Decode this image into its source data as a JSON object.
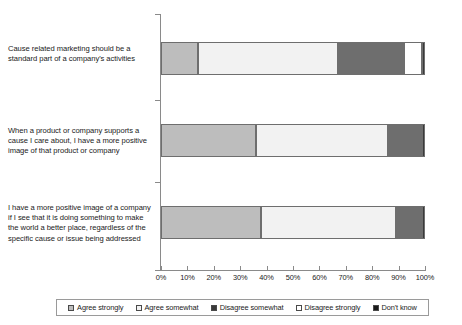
{
  "chart_data": {
    "type": "bar",
    "orientation": "horizontal",
    "stacked": true,
    "stack_mode": "percent",
    "title": "",
    "xlabel": "",
    "ylabel": "",
    "xlim": [
      0,
      100
    ],
    "grid": false,
    "legend_position": "bottom",
    "xticks": [
      "0%",
      "10%",
      "20%",
      "30%",
      "40%",
      "50%",
      "60%",
      "70%",
      "80%",
      "90%",
      "100%"
    ],
    "xtick_values": [
      0,
      10,
      20,
      30,
      40,
      50,
      60,
      70,
      80,
      90,
      100
    ],
    "categories": [
      "Cause related marketing should be a standard part of a company's activities",
      "When a product or company supports a cause I care about, I have a more positive image of that product or company",
      "I have a more positive image of a company if I see that it is doing something to make the world a better place, regardless of the specific cause or issue being addressed"
    ],
    "series": [
      {
        "name": "Agree strongly",
        "color": "#bdbdbd",
        "values": [
          14,
          36,
          38
        ]
      },
      {
        "name": "Agree somewhat",
        "color": "#f2f2f2",
        "values": [
          53,
          50,
          51
        ]
      },
      {
        "name": "Disagree somewhat",
        "color": "#6e6e6e",
        "values": [
          25,
          12,
          9
        ]
      },
      {
        "name": "Disagree strongly",
        "color": "#ffffff",
        "values": [
          7,
          1,
          1
        ]
      },
      {
        "name": "Don't know",
        "color": "#3a3a3a",
        "values": [
          1,
          1,
          1
        ]
      }
    ],
    "legend": [
      {
        "label": "Agree strongly",
        "color": "#bdbdbd"
      },
      {
        "label": "Agree somewhat",
        "color": "#f2f2f2"
      },
      {
        "label": "Disagree somewhat",
        "color": "#3a3a3a"
      },
      {
        "label": "Disagree strongly",
        "color": "#ffffff"
      },
      {
        "label": "Don't know",
        "color": "#1a1a1a"
      }
    ]
  }
}
